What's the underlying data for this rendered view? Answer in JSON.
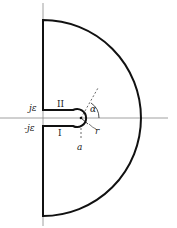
{
  "diagram": {
    "type": "contour-integration-path",
    "labels": {
      "upper_offset": "jε",
      "lower_offset": "-jε",
      "upper_segment": "II",
      "lower_segment": "I",
      "angle": "α",
      "radius": "r",
      "center_point": "a"
    },
    "colors": {
      "contour": "#111111",
      "axes": "#777777",
      "text": "#222222"
    }
  }
}
